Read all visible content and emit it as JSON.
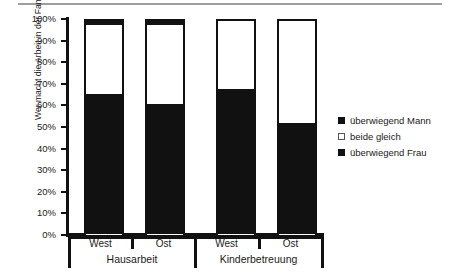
{
  "chart_data": {
    "type": "bar",
    "subtype": "stacked-100-percent",
    "title": "",
    "xlabel": "",
    "ylabel": "Wer macht die Arbeit in der Familie (%)?",
    "ylim": [
      0,
      100
    ],
    "ytick_labels": [
      "100%",
      "90%",
      "80%",
      "70%",
      "60%",
      "50%",
      "40%",
      "30%",
      "20%",
      "10%",
      "0%"
    ],
    "ytick_values": [
      100,
      90,
      80,
      70,
      60,
      50,
      40,
      30,
      20,
      10,
      0
    ],
    "grid": false,
    "legend_position": "right",
    "groups": [
      {
        "label": "Hausarbeit",
        "categories": [
          "West",
          "Ost"
        ]
      },
      {
        "label": "Kinderbetreuung",
        "categories": [
          "West",
          "Ost"
        ]
      }
    ],
    "categories": [
      "West",
      "Ost",
      "West",
      "Ost"
    ],
    "series": [
      {
        "name": "überwiegend Mann",
        "color": "#111111",
        "values": [
          2,
          2,
          0,
          0
        ]
      },
      {
        "name": "beide gleich",
        "color": "#ffffff",
        "values": [
          32,
          37,
          32,
          48
        ]
      },
      {
        "name": "überwiegend Frau",
        "color": "#111111",
        "values": [
          66,
          61,
          68,
          52
        ]
      }
    ],
    "bars": [
      {
        "group": "Hausarbeit",
        "category": "West",
        "ueberwiegend_frau": 66,
        "beide_gleich": 32,
        "ueberwiegend_mann": 2
      },
      {
        "group": "Hausarbeit",
        "category": "Ost",
        "ueberwiegend_frau": 61,
        "beide_gleich": 37,
        "ueberwiegend_mann": 2
      },
      {
        "group": "Kinderbetreuung",
        "category": "West",
        "ueberwiegend_frau": 68,
        "beide_gleich": 32,
        "ueberwiegend_mann": 0
      },
      {
        "group": "Kinderbetreuung",
        "category": "Ost",
        "ueberwiegend_frau": 52,
        "beide_gleich": 48,
        "ueberwiegend_mann": 0
      }
    ],
    "legend": [
      {
        "label": "überwiegend Mann",
        "swatch": "filled"
      },
      {
        "label": "beide gleich",
        "swatch": "open"
      },
      {
        "label": "überwiegend Frau",
        "swatch": "filled"
      }
    ]
  }
}
